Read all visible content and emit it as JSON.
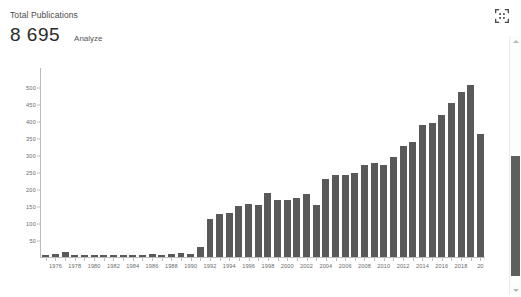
{
  "header": {
    "kpi_label": "Total Publications",
    "kpi_value": "8 695",
    "analyze_label": "Analyze"
  },
  "icons": {
    "collapse": "collapse-arrows-icon",
    "scroll_up": "scroll-up-arrow-icon",
    "scroll_down": "scroll-down-arrow-icon"
  },
  "colors": {
    "bar": "#595959",
    "axis": "#bdbdbd",
    "tick_text": "#6b6b6b",
    "value_text": "#2b2b2b",
    "scrollbar_thumb": "#5e5e5e"
  },
  "chart_data": {
    "type": "bar",
    "title": "",
    "xlabel": "",
    "ylabel": "",
    "ylim": [
      0,
      560
    ],
    "grid": false,
    "legend": "none",
    "y_ticks": [
      50,
      100,
      150,
      200,
      250,
      300,
      350,
      400,
      450,
      500
    ],
    "x_tick_labels": [
      "1976",
      "1978",
      "1980",
      "1982",
      "1984",
      "1986",
      "1988",
      "1990",
      "1992",
      "1994",
      "1996",
      "1998",
      "2000",
      "2002",
      "2004",
      "2006",
      "2008",
      "2010",
      "2012",
      "2014",
      "2016",
      "2018",
      "20"
    ],
    "categories": [
      "1975",
      "1976",
      "1977",
      "1978",
      "1979",
      "1980",
      "1981",
      "1982",
      "1983",
      "1984",
      "1985",
      "1986",
      "1987",
      "1988",
      "1989",
      "1990",
      "1991",
      "1992",
      "1993",
      "1994",
      "1995",
      "1996",
      "1997",
      "1998",
      "1999",
      "2000",
      "2001",
      "2002",
      "2003",
      "2004",
      "2005",
      "2006",
      "2007",
      "2008",
      "2009",
      "2010",
      "2011",
      "2012",
      "2013",
      "2014",
      "2015",
      "2016",
      "2017",
      "2018",
      "2019",
      "2020"
    ],
    "values": [
      6,
      8,
      14,
      6,
      7,
      6,
      7,
      6,
      7,
      6,
      7,
      9,
      7,
      8,
      11,
      10,
      30,
      112,
      128,
      130,
      150,
      158,
      155,
      190,
      168,
      170,
      175,
      188,
      155,
      232,
      243,
      243,
      249,
      274,
      278,
      272,
      296,
      330,
      340,
      392,
      398,
      420,
      455,
      490,
      510,
      365
    ],
    "bar_color": "#595959"
  }
}
